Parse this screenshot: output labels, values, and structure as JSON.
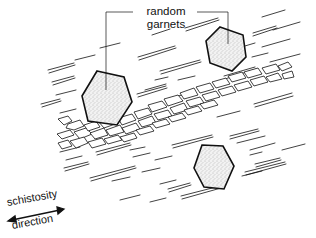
{
  "diagram": {
    "labels": {
      "garnets_line1": "random",
      "garnets_line2": "garnets",
      "schistosity_line1": "schistosity",
      "schistosity_line2": "direction"
    },
    "garnets": [
      {
        "id": "left",
        "cx": 107,
        "cy": 98,
        "r": 25
      },
      {
        "id": "upper-right",
        "cx": 228,
        "cy": 43,
        "r": 22
      },
      {
        "id": "lower-right",
        "cx": 213,
        "cy": 170,
        "r": 22
      }
    ],
    "colors": {
      "ink": "#111111",
      "garnet_fill": "#e6e6e6",
      "background": "#ffffff"
    }
  }
}
